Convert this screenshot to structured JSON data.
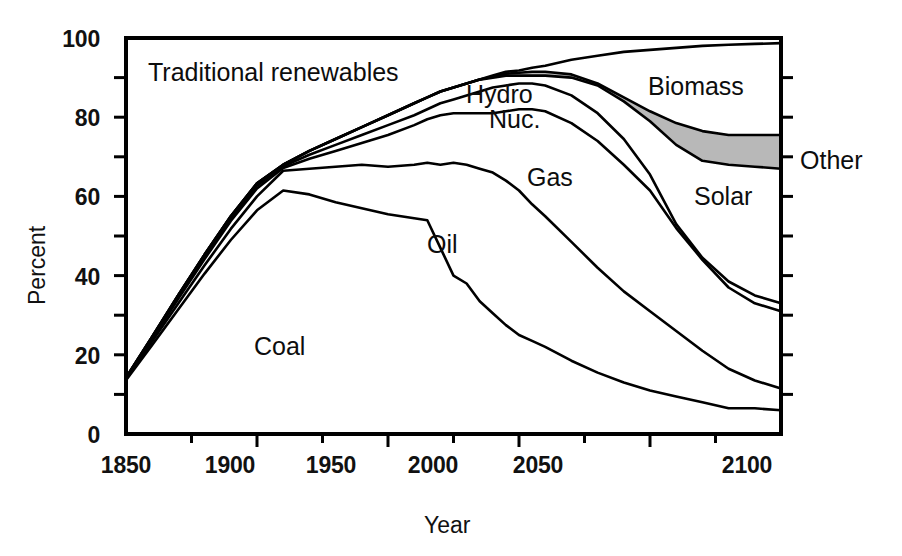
{
  "chart_data": {
    "type": "area",
    "title": "",
    "subtitle": "",
    "xlabel": "Year",
    "ylabel": "Percent",
    "xlim": [
      1850,
      2100
    ],
    "ylim": [
      0,
      100
    ],
    "grid": false,
    "legend_position": "inline-annotations",
    "x_ticks": [
      "1850",
      "1900",
      "1950",
      "2000",
      "2050",
      "2100"
    ],
    "x_tick_values": [
      1850,
      1900,
      1950,
      2000,
      2050,
      2100
    ],
    "x_minor_tick_values": [
      1875,
      1925,
      1975,
      2025,
      2075
    ],
    "y_ticks": [
      "0",
      "20",
      "40",
      "60",
      "80",
      "100"
    ],
    "y_tick_values": [
      0,
      20,
      40,
      60,
      80,
      100
    ],
    "y_minor_tick_values": [
      10,
      30,
      50,
      70,
      90
    ],
    "annotations": [
      {
        "text": "Traditional renewables",
        "x": 1875,
        "y": 91
      },
      {
        "text": "Coal",
        "x": 1924,
        "y": 22
      },
      {
        "text": "Oil",
        "x": 1968,
        "y": 47
      },
      {
        "text": "Gas",
        "x": 1994,
        "y": 63
      },
      {
        "text": "Hydro",
        "x": 2003,
        "y": 85
      },
      {
        "text": "Nuc.",
        "x": 2005,
        "y": 79
      },
      {
        "text": "Biomass",
        "x": 2047,
        "y": 87
      },
      {
        "text": "Solar",
        "x": 2060,
        "y": 63
      },
      {
        "text": "Other",
        "x": 2112,
        "y": 70
      }
    ],
    "x": [
      1850,
      1860,
      1870,
      1880,
      1890,
      1900,
      1910,
      1920,
      1930,
      1940,
      1950,
      1960,
      1965,
      1970,
      1975,
      1980,
      1985,
      1990,
      1995,
      2000,
      2005,
      2010,
      2020,
      2030,
      2040,
      2050,
      2060,
      2070,
      2080,
      2090,
      2100
    ],
    "series": [
      {
        "name": "Coal",
        "note": "lowest cumulative boundary",
        "values": [
          13.6,
          22.5,
          31.5,
          40.5,
          49.0,
          56.5,
          61.5,
          60.5,
          58.5,
          57.0,
          55.5,
          54.5,
          54.0,
          47.0,
          40.0,
          38.0,
          33.5,
          30.5,
          27.5,
          25.0,
          23.5,
          22.0,
          18.5,
          15.5,
          13.0,
          11.0,
          9.5,
          8.0,
          6.5,
          6.5,
          6.0
        ]
      },
      {
        "name": "Oil",
        "note": "cumulative Coal+Oil boundary",
        "values": [
          13.8,
          23.4,
          33.0,
          42.6,
          51.8,
          60.0,
          66.5,
          67.0,
          67.5,
          68.0,
          67.5,
          68.0,
          68.5,
          68.0,
          68.5,
          68.0,
          67.0,
          66.0,
          64.0,
          61.5,
          58.0,
          55.0,
          48.5,
          42.0,
          36.0,
          31.0,
          26.0,
          21.0,
          16.5,
          13.5,
          11.5
        ]
      },
      {
        "name": "Gas",
        "note": "cumulative Coal+Oil+Gas boundary",
        "values": [
          14.0,
          24.0,
          34.2,
          44.2,
          53.8,
          62.0,
          67.2,
          69.5,
          71.5,
          73.5,
          75.5,
          78.0,
          79.5,
          80.5,
          81.0,
          81.0,
          81.0,
          81.0,
          81.5,
          82.0,
          82.0,
          81.5,
          78.5,
          74.0,
          68.0,
          61.5,
          52.0,
          44.0,
          37.0,
          33.0,
          31.0
        ]
      },
      {
        "name": "Nuc.",
        "note": "cumulative + nuclear boundary",
        "values": [
          14.1,
          24.3,
          34.7,
          44.8,
          54.4,
          62.7,
          67.6,
          70.5,
          73.0,
          75.5,
          78.0,
          80.5,
          82.0,
          83.5,
          84.5,
          85.5,
          86.5,
          87.5,
          88.0,
          88.5,
          88.5,
          88.0,
          85.5,
          81.0,
          74.5,
          65.5,
          53.0,
          44.5,
          38.5,
          35.0,
          33.0
        ]
      },
      {
        "name": "Hydro",
        "note": "cumulative + hydro boundary",
        "values": [
          14.2,
          24.6,
          35.1,
          45.3,
          55.0,
          63.3,
          68.0,
          71.5,
          74.5,
          77.5,
          80.5,
          83.5,
          85.0,
          86.5,
          87.5,
          88.5,
          89.5,
          90.0,
          90.5,
          90.5,
          90.5,
          90.5,
          90.0,
          88.0,
          84.0,
          79.0,
          73.0,
          69.0,
          68.0,
          67.5,
          67.0
        ]
      },
      {
        "name": "Solar",
        "note": "top of grey Other band / solar boundary",
        "values": [
          14.2,
          24.6,
          35.1,
          45.3,
          55.0,
          63.3,
          68.0,
          71.5,
          74.5,
          77.5,
          80.5,
          83.5,
          85.0,
          86.5,
          87.5,
          88.5,
          89.5,
          90.2,
          91.0,
          91.2,
          91.5,
          91.5,
          90.8,
          88.5,
          85.0,
          81.5,
          78.5,
          76.5,
          75.5,
          75.5,
          75.5
        ]
      },
      {
        "name": "Biomass",
        "note": "topmost boundary, approaches 100%",
        "values": [
          14.2,
          24.6,
          35.1,
          45.3,
          55.0,
          63.3,
          68.0,
          71.5,
          74.5,
          77.5,
          80.5,
          83.5,
          85.0,
          86.5,
          87.5,
          88.5,
          89.5,
          90.5,
          91.5,
          91.8,
          92.5,
          93.0,
          94.5,
          95.5,
          96.5,
          97.0,
          97.5,
          98.0,
          98.3,
          98.5,
          98.7
        ]
      }
    ],
    "shaded_band": {
      "name": "Other",
      "fill_color": "#b8b8b8",
      "between": [
        "Hydro",
        "Solar"
      ]
    },
    "colors": {
      "line": "#000000",
      "background": "#ffffff",
      "band_grey": "#b8b8b8",
      "text": "#111111"
    }
  }
}
